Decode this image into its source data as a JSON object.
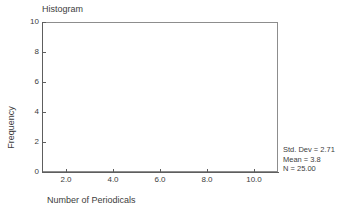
{
  "chart_data": {
    "type": "bar",
    "title": "Histogram",
    "xlabel": "Number of Periodicals",
    "ylabel": "Frequency",
    "xlim": [
      1,
      11
    ],
    "ylim": [
      0,
      10
    ],
    "grid": false,
    "legend": "none",
    "xticks": [
      2.0,
      4.0,
      6.0,
      8.0,
      10.0
    ],
    "xtick_labels": [
      "2.0",
      "4.0",
      "6.0",
      "8.0",
      "10.0"
    ],
    "yticks": [
      0,
      2,
      4,
      6,
      8,
      10
    ],
    "ytick_labels": [
      "0",
      "2",
      "4",
      "6",
      "8",
      "10"
    ],
    "categories": [],
    "values": [],
    "annotations": [
      "Std. Dev = 2.71",
      "Mean = 3.8",
      "N = 25.00"
    ]
  },
  "statistics": {
    "std_dev_label": "Std. Dev = 2.71",
    "mean_label": "Mean = 3.8",
    "n_label": "N = 25.00"
  },
  "colors": {
    "axis": "#5e5e5e",
    "frame": "#8d8d8d",
    "text": "#3d3d3d",
    "background": "#ffffff",
    "bar_fill": "#b9b9b9"
  }
}
